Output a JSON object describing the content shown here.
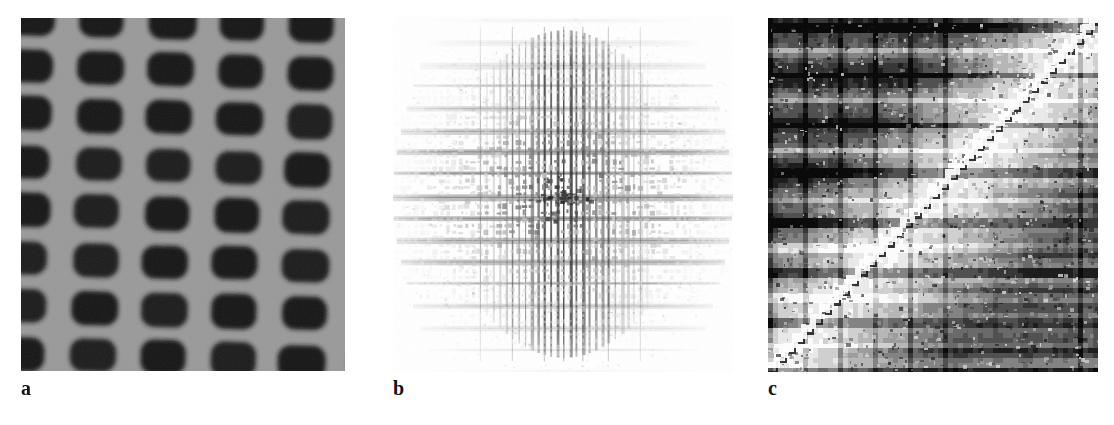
{
  "figure": {
    "background_color": "#ffffff",
    "width": 1114,
    "height": 425,
    "panel_count": 3
  },
  "panels": [
    {
      "id": "a",
      "label": "a",
      "kind": "micrograph",
      "description": "Periodic lattice of dark rounded-rectangular features on uniform gray background",
      "background_color": "#9a9a9a",
      "feature_color": "#161616",
      "lattice": {
        "period_x": 70,
        "period_y": 48,
        "feature_width": 46,
        "feature_height": 34,
        "corner_radius": 13,
        "rotation_deg": 1.6,
        "columns": 6,
        "rows": 9,
        "row_offset_x": 0
      },
      "noise_level": 0.09
    },
    {
      "id": "b",
      "label": "b",
      "kind": "fourier-magnitude",
      "description": "Fourier magnitude spectrum: bright white field with a dark cross of vertical striping and horizontal bands, dense checkered central cluster",
      "background_color": "#ffffff",
      "center_x": 0.5,
      "center_y": 0.5,
      "vertical_stripe_count": 27,
      "horizontal_band_count": 19,
      "central_cluster_radius": 0.33,
      "max_darkness": "#101010"
    },
    {
      "id": "c",
      "label": "c",
      "kind": "phase-map",
      "description": "High-contrast quantized phase map with an anti-diagonal discontinuity; dark upper-left and lower-right triangles, bright staircase ridge along the diagonal, strong horizontal bands",
      "background_color": "#f2f2f2",
      "dark_color": "#0c0c0c",
      "mid_color": "#8a8a8a",
      "light_color": "#fdfdfd",
      "diagonal": "lower-left to upper-right",
      "horizontal_band_count": 16,
      "vertical_stripe_count": 22,
      "staircase_step": 8
    }
  ],
  "labels": {
    "a": "a",
    "b": "b",
    "c": "c"
  },
  "chart_data": {
    "type": "heatmap",
    "title": "",
    "subtitle": "",
    "xlabel": "",
    "ylabel": "",
    "grid": false,
    "legend": "none",
    "panels": [
      {
        "name": "a",
        "caption": "a",
        "content": "real-space periodic lattice image",
        "grayscale_range": [
          8,
          160
        ],
        "dominant_values": {
          "background": 154,
          "features": 22
        }
      },
      {
        "name": "b",
        "caption": "b",
        "content": "reciprocal-space magnitude, cross-shaped energy distribution",
        "grayscale_range": [
          16,
          255
        ],
        "dominant_values": {
          "background": 252,
          "center": 30
        }
      },
      {
        "name": "c",
        "caption": "c",
        "content": "quantized phase map with anti-diagonal discontinuity",
        "grayscale_range": [
          10,
          253
        ],
        "dominant_values": {
          "dark_triangles": 12,
          "mid_bands": 138,
          "bright_ridge": 250
        }
      }
    ]
  }
}
